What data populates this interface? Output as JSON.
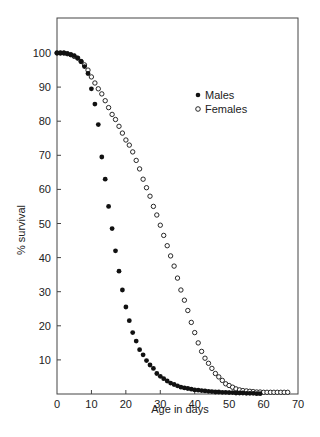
{
  "chart_data": {
    "type": "scatter",
    "title": "",
    "xlabel": "Age in days",
    "ylabel": "% survival",
    "xlim": [
      0,
      70
    ],
    "ylim": [
      0,
      110
    ],
    "x_ticks": [
      0,
      10,
      20,
      30,
      40,
      50,
      60,
      70
    ],
    "y_ticks": [
      10,
      20,
      30,
      40,
      50,
      60,
      70,
      80,
      90,
      100
    ],
    "grid": false,
    "legend_position": "upper right (inside)",
    "series": [
      {
        "name": "Males",
        "marker": "filled-circle",
        "color": "#111111",
        "points": [
          [
            0,
            100
          ],
          [
            1,
            100
          ],
          [
            2,
            100
          ],
          [
            3,
            99.8
          ],
          [
            4,
            99.5
          ],
          [
            5,
            99.2
          ],
          [
            6,
            98.5
          ],
          [
            7,
            97.5
          ],
          [
            8,
            96
          ],
          [
            9,
            94
          ],
          [
            10,
            89.5
          ],
          [
            11,
            85
          ],
          [
            12,
            79
          ],
          [
            13,
            69.5
          ],
          [
            14,
            63
          ],
          [
            15,
            55
          ],
          [
            16,
            48.5
          ],
          [
            17,
            42
          ],
          [
            18,
            36
          ],
          [
            19,
            30.5
          ],
          [
            20,
            25.5
          ],
          [
            21,
            21.5
          ],
          [
            22,
            18
          ],
          [
            23,
            15.5
          ],
          [
            24,
            13
          ],
          [
            25,
            11.5
          ],
          [
            26,
            9.8
          ],
          [
            27,
            8.5
          ],
          [
            28,
            7.5
          ],
          [
            29,
            6
          ],
          [
            30,
            5.2
          ],
          [
            31,
            4.5
          ],
          [
            32,
            3.8
          ],
          [
            33,
            3.2
          ],
          [
            34,
            2.8
          ],
          [
            35,
            2.4
          ],
          [
            36,
            2
          ],
          [
            37,
            1.8
          ],
          [
            38,
            1.6
          ],
          [
            39,
            1.4
          ],
          [
            40,
            1.2
          ],
          [
            41,
            1.1
          ],
          [
            42,
            1
          ],
          [
            43,
            0.9
          ],
          [
            44,
            0.8
          ],
          [
            45,
            0.7
          ],
          [
            46,
            0.6
          ],
          [
            47,
            0.6
          ],
          [
            48,
            0.5
          ],
          [
            49,
            0.5
          ],
          [
            50,
            0.4
          ],
          [
            51,
            0.4
          ],
          [
            52,
            0.3
          ],
          [
            53,
            0.3
          ],
          [
            54,
            0.3
          ],
          [
            55,
            0.2
          ],
          [
            56,
            0.2
          ],
          [
            57,
            0.2
          ],
          [
            58,
            0.1
          ],
          [
            59,
            0.1
          ]
        ]
      },
      {
        "name": "Females",
        "marker": "open-circle",
        "color": "#111111",
        "points": [
          [
            0,
            100
          ],
          [
            1,
            100
          ],
          [
            2,
            100
          ],
          [
            3,
            99.8
          ],
          [
            4,
            99.5
          ],
          [
            5,
            99
          ],
          [
            6,
            98.5
          ],
          [
            7,
            97.5
          ],
          [
            8,
            96.5
          ],
          [
            9,
            95
          ],
          [
            10,
            93
          ],
          [
            11,
            91.2
          ],
          [
            12,
            89.5
          ],
          [
            13,
            88
          ],
          [
            14,
            86
          ],
          [
            15,
            84
          ],
          [
            16,
            82
          ],
          [
            17,
            80.5
          ],
          [
            18,
            78.5
          ],
          [
            19,
            76.5
          ],
          [
            20,
            74.5
          ],
          [
            21,
            73
          ],
          [
            22,
            71
          ],
          [
            23,
            68.5
          ],
          [
            24,
            66
          ],
          [
            25,
            63
          ],
          [
            26,
            60.5
          ],
          [
            27,
            58
          ],
          [
            28,
            55
          ],
          [
            29,
            52.5
          ],
          [
            30,
            49.5
          ],
          [
            31,
            46.5
          ],
          [
            32,
            43.5
          ],
          [
            33,
            40.5
          ],
          [
            34,
            37.5
          ],
          [
            35,
            34
          ],
          [
            36,
            30.5
          ],
          [
            37,
            27.5
          ],
          [
            38,
            24.5
          ],
          [
            39,
            21
          ],
          [
            40,
            18
          ],
          [
            41,
            15
          ],
          [
            42,
            12.5
          ],
          [
            43,
            10.5
          ],
          [
            44,
            9
          ],
          [
            45,
            7.5
          ],
          [
            46,
            6
          ],
          [
            47,
            5
          ],
          [
            48,
            4
          ],
          [
            49,
            3
          ],
          [
            50,
            2.5
          ],
          [
            51,
            2
          ],
          [
            52,
            1.5
          ],
          [
            53,
            1.2
          ],
          [
            54,
            1
          ],
          [
            55,
            0.9
          ],
          [
            56,
            0.8
          ],
          [
            57,
            0.7
          ],
          [
            58,
            0.6
          ],
          [
            59,
            0.6
          ],
          [
            60,
            0.5
          ],
          [
            61,
            0.5
          ],
          [
            62,
            0.5
          ],
          [
            63,
            0.5
          ],
          [
            64,
            0.5
          ],
          [
            65,
            0.5
          ],
          [
            66,
            0.5
          ],
          [
            67,
            0.5
          ]
        ]
      }
    ]
  },
  "legend": {
    "males_label": "Males",
    "females_label": "Females"
  },
  "axes": {
    "xlabel": "Age in days",
    "ylabel": "% survival"
  }
}
